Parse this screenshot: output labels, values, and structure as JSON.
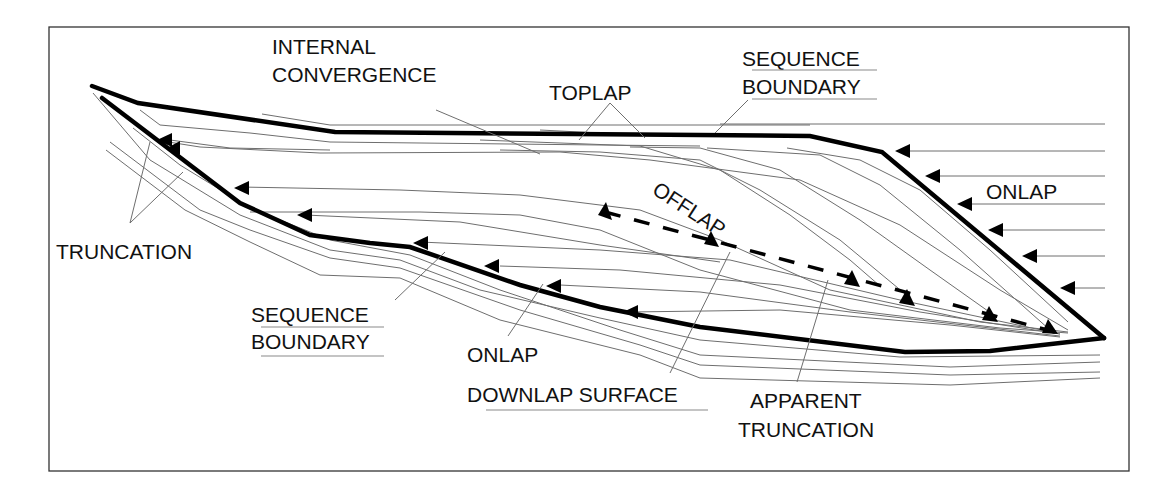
{
  "diagram": {
    "colors": {
      "line": "#000000",
      "thin_line": "#6e6e6e",
      "frame": "#333333",
      "background": "#ffffff"
    },
    "labels": {
      "internal_convergence_1": "INTERNAL",
      "internal_convergence_2": "CONVERGENCE",
      "toplap": "TOPLAP",
      "sequence_boundary_top_1": "SEQUENCE",
      "sequence_boundary_top_2": "BOUNDARY",
      "onlap_right": "ONLAP",
      "offlap": "OFFLAP",
      "truncation": "TRUNCATION",
      "sequence_boundary_bottom_1": "SEQUENCE",
      "sequence_boundary_bottom_2": "BOUNDARY",
      "onlap_bottom": "ONLAP",
      "downlap_surface": "DOWNLAP SURFACE",
      "apparent_truncation_1": "APPARENT",
      "apparent_truncation_2": "TRUNCATION"
    },
    "terms": [
      "Internal convergence",
      "Toplap",
      "Sequence boundary",
      "Onlap",
      "Offlap",
      "Truncation",
      "Downlap surface",
      "Apparent truncation"
    ]
  }
}
